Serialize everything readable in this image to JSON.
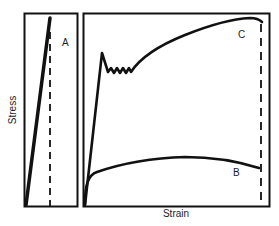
{
  "figure": {
    "y_axis_label": "Stress",
    "x_axis_label": "Strain",
    "panels": [
      {
        "id": "left",
        "curves": [
          {
            "label": "A",
            "description": "brittle: linear elastic to fracture"
          }
        ]
      },
      {
        "id": "right",
        "curves": [
          {
            "label": "C",
            "description": "ductile with yield point drop and serrated yielding, strain hardening to high stress"
          },
          {
            "label": "B",
            "description": "low-strength ductile, gradual yielding, large strain"
          }
        ]
      }
    ],
    "fracture_marker": "dashed vertical line",
    "caption_fragment": ""
  },
  "colors": {
    "line": "#111111",
    "frame": "#111111",
    "background": "#ffffff"
  }
}
